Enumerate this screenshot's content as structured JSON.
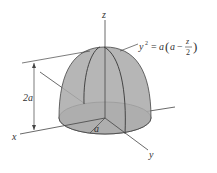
{
  "figure": {
    "axes": {
      "z_label": "z",
      "x_label": "x",
      "y_label": "y"
    },
    "equation": {
      "lhs": "y",
      "exp": "2",
      "rhs_a": "a",
      "open": "(",
      "inner_a": "a",
      "minus": "−",
      "num": "z",
      "den": "2",
      "close": ")"
    },
    "height_label": "2a",
    "radius_label": "a",
    "colors": {
      "dome_fill": "#a9a9a9",
      "base_fill": "#c9c9c9",
      "line": "#444444"
    }
  }
}
